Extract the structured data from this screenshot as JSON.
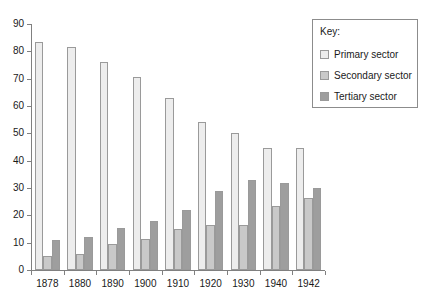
{
  "chart_data": {
    "type": "bar",
    "title": "",
    "xlabel": "",
    "ylabel": "",
    "ylim": [
      0,
      90
    ],
    "ytick_step": 10,
    "yticks": [
      0,
      10,
      20,
      30,
      40,
      50,
      60,
      70,
      80,
      90
    ],
    "grid": false,
    "legend_position": "top-right",
    "categories": [
      "1878",
      "1880",
      "1890",
      "1900",
      "1910",
      "1920",
      "1930",
      "1940",
      "1942"
    ],
    "series": [
      {
        "name": "Primary sector",
        "color": "#ededed",
        "values": [
          83.5,
          81.5,
          76,
          70.5,
          63,
          54,
          50,
          44.5,
          44.5
        ]
      },
      {
        "name": "Secondary sector",
        "color": "#c9c9c9",
        "values": [
          5,
          6,
          9.5,
          11.5,
          15,
          16.5,
          16.5,
          23.5,
          26.5
        ]
      },
      {
        "name": "Tertiary sector",
        "color": "#9e9e9e",
        "values": [
          11,
          12,
          15.5,
          18,
          22,
          29,
          33,
          32,
          30
        ]
      }
    ]
  },
  "legend": {
    "title": "Key:",
    "entries": [
      {
        "label": "Primary sector"
      },
      {
        "label": "Secondary sector"
      },
      {
        "label": "Tertiary sector"
      }
    ]
  }
}
